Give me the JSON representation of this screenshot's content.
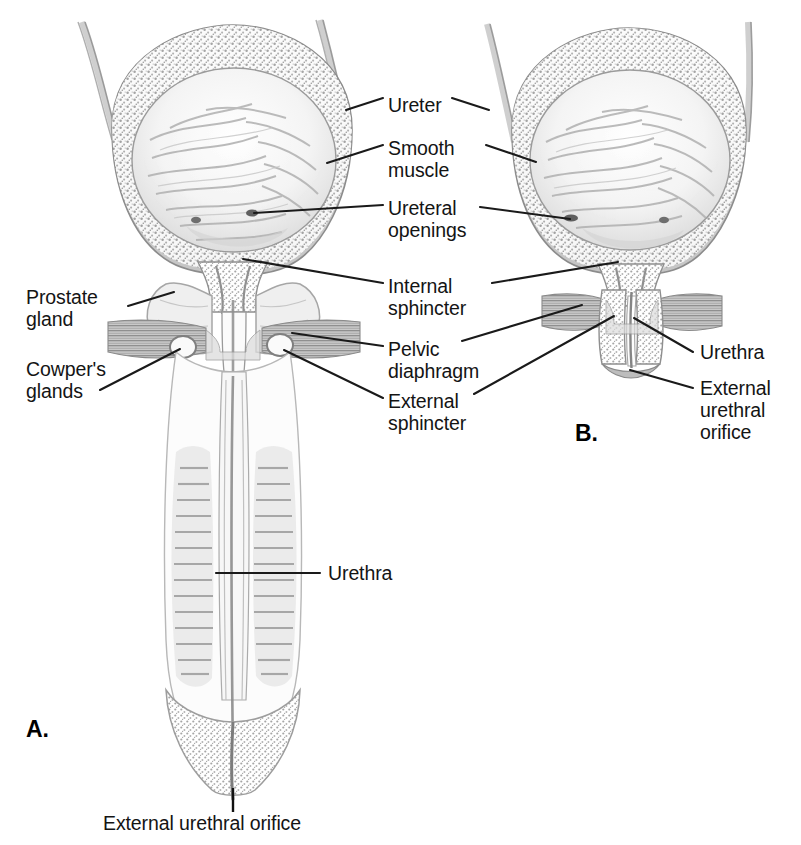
{
  "figure": {
    "panels": [
      {
        "id": "A",
        "letter": "A.",
        "subject": "male bladder, prostate and penile urethra"
      },
      {
        "id": "B",
        "letter": "B.",
        "subject": "female bladder and urethra"
      }
    ],
    "ink_color": "#141414",
    "line_color": "#1a1a1a",
    "background": "#ffffff"
  },
  "labels": {
    "ureter": "Ureter",
    "smooth_muscle_l1": "Smooth",
    "smooth_muscle_l2": "muscle",
    "ureteral_openings_l1": "Ureteral",
    "ureteral_openings_l2": "openings",
    "internal_sphincter_l1": "Internal",
    "internal_sphincter_l2": "sphincter",
    "pelvic_diaphragm_l1": "Pelvic",
    "pelvic_diaphragm_l2": "diaphragm",
    "external_sphincter_l1": "External",
    "external_sphincter_l2": "sphincter",
    "prostate_gland_l1": "Prostate",
    "prostate_gland_l2": "gland",
    "cowpers_glands_l1": "Cowper's",
    "cowpers_glands_l2": "glands",
    "urethra_a": "Urethra",
    "urethra_b": "Urethra",
    "external_urethral_orifice_b_l1": "External",
    "external_urethral_orifice_b_l2": "urethral",
    "external_urethral_orifice_b_l3": "orifice",
    "external_urethral_orifice_a": "External urethral orifice"
  }
}
